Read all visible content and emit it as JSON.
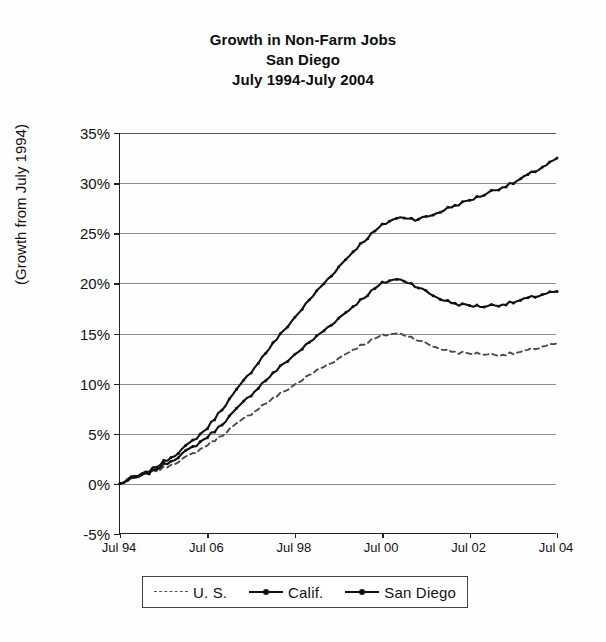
{
  "title": {
    "line1": "Growth in Non-Farm Jobs",
    "line2": "San Diego",
    "line3": "July 1994-July 2004"
  },
  "axis": {
    "y_title": "(Growth from July 1994)",
    "y_ticks": [
      "35%",
      "30%",
      "25%",
      "20%",
      "15%",
      "10%",
      "5%",
      "0%",
      "-5%"
    ],
    "x_ticks": [
      "Jul 94",
      "Jul 06",
      "Jul 98",
      "Jul 00",
      "Jul 02",
      "Jul 04"
    ]
  },
  "legend": {
    "items": [
      {
        "label": "U. S.",
        "style": "dashed",
        "marker": false,
        "color": "#555555"
      },
      {
        "label": "Calif.",
        "style": "solid",
        "marker": true,
        "color": "#111111"
      },
      {
        "label": "San Diego",
        "style": "solid",
        "marker": true,
        "color": "#111111"
      }
    ]
  },
  "chart_data": {
    "type": "line",
    "xlabel": "",
    "ylabel": "(Growth from July 1994)",
    "ylim": [
      -5,
      35
    ],
    "xlim": [
      1994.5,
      2004.5
    ],
    "ytick_values": [
      -5,
      0,
      5,
      10,
      15,
      20,
      25,
      30,
      35
    ],
    "xtick_values": [
      1994.5,
      1996.5,
      1998.5,
      2000.5,
      2002.5,
      2004.5
    ],
    "xtick_labels": [
      "Jul 94",
      "Jul 06",
      "Jul 98",
      "Jul 00",
      "Jul 02",
      "Jul 04"
    ],
    "grid": "horizontal",
    "legend_position": "bottom",
    "x": [
      1994.5,
      1994.75,
      1995.0,
      1995.25,
      1995.5,
      1995.75,
      1996.0,
      1996.25,
      1996.5,
      1996.75,
      1997.0,
      1997.25,
      1997.5,
      1997.75,
      1998.0,
      1998.25,
      1998.5,
      1998.75,
      1999.0,
      1999.25,
      1999.5,
      1999.75,
      2000.0,
      2000.25,
      2000.5,
      2000.75,
      2001.0,
      2001.25,
      2001.5,
      2001.75,
      2002.0,
      2002.25,
      2002.5,
      2002.75,
      2003.0,
      2003.25,
      2003.5,
      2003.75,
      2004.0,
      2004.25,
      2004.5
    ],
    "series": [
      {
        "name": "U. S.",
        "style": "dashed",
        "values": [
          0.0,
          0.4,
          0.8,
          1.2,
          1.6,
          2.1,
          2.6,
          3.2,
          3.9,
          4.6,
          5.4,
          6.2,
          7.0,
          7.8,
          8.5,
          9.2,
          9.9,
          10.6,
          11.3,
          11.9,
          12.5,
          13.2,
          13.8,
          14.3,
          14.8,
          15.0,
          14.9,
          14.5,
          14.0,
          13.6,
          13.3,
          13.1,
          13.0,
          13.0,
          12.9,
          12.9,
          13.0,
          13.2,
          13.5,
          13.8,
          14.0
        ]
      },
      {
        "name": "Calif.",
        "style": "solid",
        "values": [
          0.0,
          0.5,
          0.8,
          1.3,
          1.9,
          2.5,
          3.2,
          3.9,
          4.7,
          5.6,
          6.7,
          7.8,
          8.9,
          10.0,
          11.0,
          12.0,
          12.9,
          13.8,
          14.7,
          15.6,
          16.5,
          17.4,
          18.3,
          19.2,
          20.0,
          20.4,
          20.3,
          19.8,
          19.2,
          18.6,
          18.2,
          17.9,
          17.8,
          17.7,
          17.8,
          17.9,
          18.1,
          18.4,
          18.7,
          19.0,
          19.2
        ]
      },
      {
        "name": "San Diego",
        "style": "solid",
        "values": [
          0.0,
          0.6,
          0.9,
          1.5,
          2.2,
          2.9,
          3.7,
          4.6,
          5.6,
          7.0,
          8.4,
          9.8,
          11.2,
          12.6,
          14.0,
          15.3,
          16.6,
          17.9,
          19.2,
          20.4,
          21.6,
          22.8,
          23.9,
          24.9,
          25.8,
          26.4,
          26.6,
          26.4,
          26.6,
          27.0,
          27.5,
          27.9,
          28.3,
          28.7,
          29.2,
          29.6,
          30.0,
          30.6,
          31.2,
          31.8,
          32.5
        ]
      }
    ]
  }
}
